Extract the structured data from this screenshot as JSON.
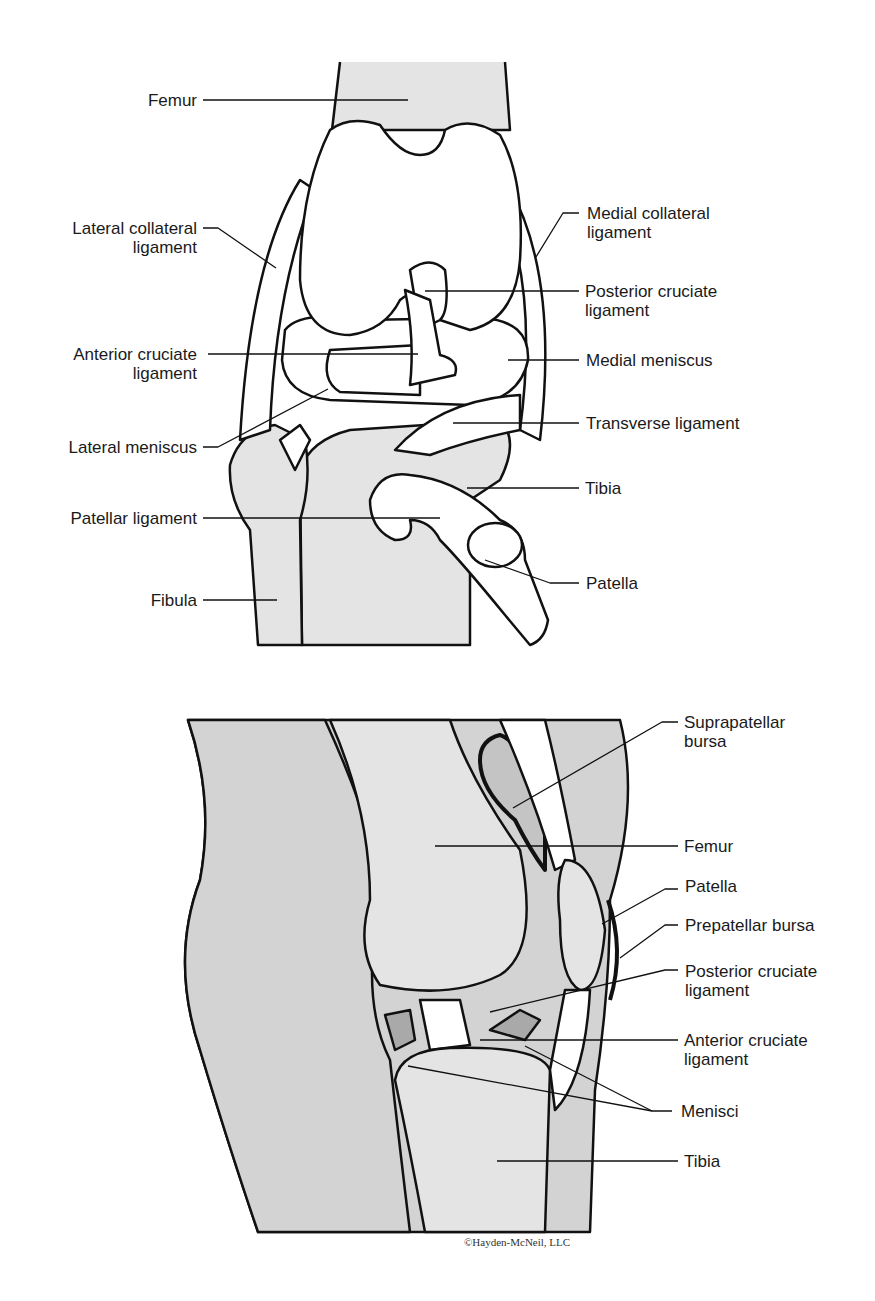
{
  "colors": {
    "bone_fill": "#e4e4e4",
    "soft_tissue": "#d3d3d3",
    "meniscus_dark": "#a9a9a9",
    "stroke": "#111111",
    "paper": "#ffffff"
  },
  "anterior_view": {
    "labels_left": [
      {
        "line1": "Femur",
        "line2": ""
      },
      {
        "line1": "Lateral collateral",
        "line2": "ligament"
      },
      {
        "line1": "Anterior cruciate",
        "line2": "ligament"
      },
      {
        "line1": "Lateral meniscus",
        "line2": ""
      },
      {
        "line1": "Patellar ligament",
        "line2": ""
      },
      {
        "line1": "Fibula",
        "line2": ""
      }
    ],
    "labels_right": [
      {
        "line1": "Medial collateral",
        "line2": "ligament"
      },
      {
        "line1": "Posterior cruciate",
        "line2": "ligament"
      },
      {
        "line1": "Medial meniscus",
        "line2": ""
      },
      {
        "line1": "Transverse ligament",
        "line2": ""
      },
      {
        "line1": "Tibia",
        "line2": ""
      },
      {
        "line1": "Patella",
        "line2": ""
      }
    ]
  },
  "sagittal_view": {
    "labels_right": [
      {
        "line1": "Suprapatellar",
        "line2": "bursa"
      },
      {
        "line1": "Femur",
        "line2": ""
      },
      {
        "line1": "Patella",
        "line2": ""
      },
      {
        "line1": "Prepatellar bursa",
        "line2": ""
      },
      {
        "line1": "Posterior cruciate",
        "line2": "ligament"
      },
      {
        "line1": "Anterior cruciate",
        "line2": "ligament"
      },
      {
        "line1": "Menisci",
        "line2": ""
      },
      {
        "line1": "Tibia",
        "line2": ""
      }
    ],
    "copyright": "©Hayden-McNeil, LLC"
  }
}
